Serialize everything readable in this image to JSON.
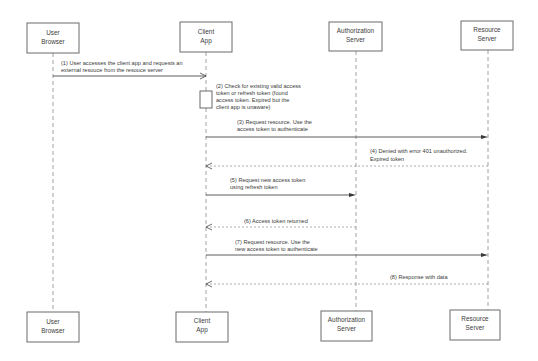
{
  "diagram": {
    "type": "sequence",
    "actors_top": [
      {
        "id": "user",
        "line1": "User",
        "line2": "Browser"
      },
      {
        "id": "client",
        "line1": "Client",
        "line2": "App"
      },
      {
        "id": "auth",
        "line1": "Authorization",
        "line2": "Server"
      },
      {
        "id": "resource",
        "line1": "Resource",
        "line2": "Server"
      }
    ],
    "actors_bottom": [
      {
        "id": "user",
        "line1": "User",
        "line2": "Browser"
      },
      {
        "id": "client",
        "line1": "Client",
        "line2": "App"
      },
      {
        "id": "auth",
        "line1": "Authorization",
        "line2": "Server"
      },
      {
        "id": "resource",
        "line1": "Resource",
        "line2": "Server"
      }
    ],
    "messages": [
      {
        "step": 1,
        "from": "User Browser",
        "to": "Client App",
        "style": "solid-open",
        "line1": "(1) User accesses the client app and requests an",
        "line2": "external resouce from the resouce server"
      },
      {
        "step": 2,
        "from": "Client App",
        "to": "Client App",
        "style": "activation",
        "line1": "(2) Check for existing valid access",
        "line2": "token or refresh token (found",
        "line3": "access token. Expired but the",
        "line4": "client app is unaware)"
      },
      {
        "step": 3,
        "from": "Client App",
        "to": "Resource Server",
        "style": "solid-filled",
        "line1": "(3) Request resource. Use the",
        "line2": "access token to authenticate"
      },
      {
        "step": 4,
        "from": "Resource Server",
        "to": "Client App",
        "style": "dashed-open",
        "line1": "(4) Denied with error 401 unauthorized.",
        "line2": "Expired token"
      },
      {
        "step": 5,
        "from": "Client App",
        "to": "Authorization Server",
        "style": "solid-filled",
        "line1": "(5) Request new access token",
        "line2": "using refresh token"
      },
      {
        "step": 6,
        "from": "Authorization Server",
        "to": "Client App",
        "style": "dashed-open",
        "line1": "(6) Access token returned"
      },
      {
        "step": 7,
        "from": "Client App",
        "to": "Resource Server",
        "style": "solid-filled",
        "line1": "(7) Request resource. Use the",
        "line2": "new access token to authenticate"
      },
      {
        "step": 8,
        "from": "Resource Server",
        "to": "Client App",
        "style": "dashed-open",
        "line1": "(8) Response with data"
      }
    ]
  }
}
